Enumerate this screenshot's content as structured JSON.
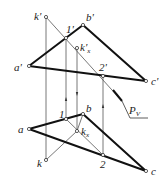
{
  "diagram": {
    "type": "descriptive-geometry-projection",
    "colors": {
      "stroke": "#1a1a1a",
      "thin": "#555555",
      "background": "#ffffff"
    },
    "labels": {
      "k_prime": "k'",
      "b_prime": "b'",
      "one_prime": "1'",
      "kx_prime_base": "k'",
      "kx_prime_sub": "x",
      "a_prime": "a'",
      "two_prime": "2'",
      "c_prime": "c'",
      "pv_base": "P",
      "pv_sub": "V",
      "one": "1",
      "b": "b",
      "a": "a",
      "kx_base": "k",
      "kx_sub": "x",
      "k": "k",
      "two": "2",
      "c": "c"
    },
    "points": {
      "front": {
        "k'": [
          46,
          17
        ],
        "b'": [
          83,
          25
        ],
        "1'": [
          66,
          38
        ],
        "kx'": [
          77,
          48
        ],
        "a'": [
          29,
          66
        ],
        "2'": [
          103,
          76
        ],
        "c'": [
          146,
          81
        ]
      },
      "top": {
        "1": [
          66,
          119
        ],
        "b": [
          83,
          114
        ],
        "a": [
          29,
          129
        ],
        "kx": [
          77,
          131
        ],
        "k": [
          46,
          160
        ],
        "2": [
          103,
          155
        ],
        "c": [
          146,
          171
        ]
      }
    }
  }
}
